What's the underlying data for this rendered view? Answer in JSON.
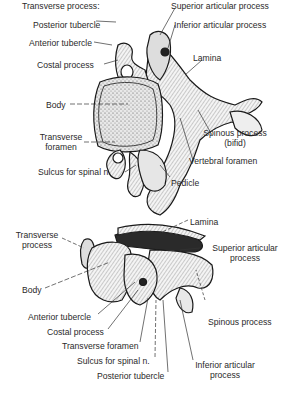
{
  "figure": {
    "top_view": {
      "heading": "Transverse process:",
      "labels": {
        "posterior_tubercle": "Posterior tubercle",
        "anterior_tubercle": "Anterior tubercle",
        "costal_process": "Costal process",
        "body": "Body",
        "transverse_foramen_1": "Transverse",
        "transverse_foramen_2": "foramen",
        "sulcus": "Sulcus for spinal n.",
        "superior_articular": "Superior articular process",
        "inferior_articular": "Inferior articular process",
        "lamina": "Lamina",
        "spinous_1": "Spinous process",
        "spinous_2": "(bifid)",
        "vertebral_foramen": "Vertebral foramen",
        "pedicle": "Pedicle"
      }
    },
    "side_view": {
      "labels": {
        "transverse_process_1": "Transverse",
        "transverse_process_2": "process",
        "body": "Body",
        "lamina": "Lamina",
        "superior_articular_1": "Superior articular",
        "superior_articular_2": "process",
        "spinous": "Spinous process",
        "anterior_tubercle": "Anterior tubercle",
        "costal_process": "Costal process",
        "transverse_foramen": "Transverse foramen",
        "sulcus": "Sulcus for spinal n.",
        "posterior_tubercle": "Posterior tubercle",
        "inferior_articular_1": "Inferior articular",
        "inferior_articular_2": "process"
      }
    }
  }
}
